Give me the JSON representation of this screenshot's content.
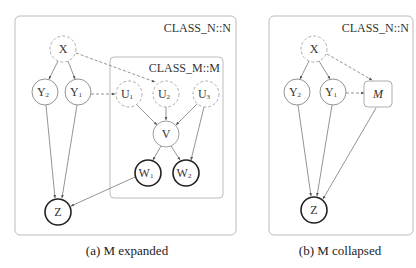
{
  "figure": {
    "panels": [
      {
        "id": "a",
        "caption": "(a) M expanded",
        "outer_class_label": "CLASS_N::N",
        "inner_class_label": "CLASS_M::M",
        "nodes": {
          "X": {
            "base": "X",
            "sub": ""
          },
          "Y2": {
            "base": "Y",
            "sub": "2"
          },
          "Y1": {
            "base": "Y",
            "sub": "1"
          },
          "U1": {
            "base": "U",
            "sub": "1"
          },
          "U2": {
            "base": "U",
            "sub": "2"
          },
          "U3": {
            "base": "U",
            "sub": "3"
          },
          "V": {
            "base": "V",
            "sub": ""
          },
          "W1": {
            "base": "W",
            "sub": "1"
          },
          "W2": {
            "base": "W",
            "sub": "2"
          },
          "Z": {
            "base": "Z",
            "sub": ""
          }
        },
        "edges": [
          {
            "from": "X",
            "to": "Y2",
            "style": "solid"
          },
          {
            "from": "X",
            "to": "Y1",
            "style": "solid"
          },
          {
            "from": "X",
            "to": "U2",
            "style": "dashed"
          },
          {
            "from": "Y1",
            "to": "U1",
            "style": "dashed"
          },
          {
            "from": "U1",
            "to": "V",
            "style": "solid"
          },
          {
            "from": "U2",
            "to": "V",
            "style": "solid"
          },
          {
            "from": "U3",
            "to": "V",
            "style": "solid"
          },
          {
            "from": "U3",
            "to": "W2",
            "style": "solid"
          },
          {
            "from": "V",
            "to": "W1",
            "style": "solid"
          },
          {
            "from": "V",
            "to": "W2",
            "style": "solid"
          },
          {
            "from": "Y2",
            "to": "Z",
            "style": "solid"
          },
          {
            "from": "Y1",
            "to": "Z",
            "style": "solid"
          },
          {
            "from": "W1",
            "to": "Z",
            "style": "solid"
          }
        ]
      },
      {
        "id": "b",
        "caption": "(b) M collapsed",
        "outer_class_label": "CLASS_N::N",
        "nodes": {
          "X": {
            "base": "X",
            "sub": ""
          },
          "Y2": {
            "base": "Y",
            "sub": "2"
          },
          "Y1": {
            "base": "Y",
            "sub": "1"
          },
          "M": {
            "base": "M",
            "sub": ""
          },
          "Z": {
            "base": "Z",
            "sub": ""
          }
        },
        "edges": [
          {
            "from": "X",
            "to": "Y2",
            "style": "solid"
          },
          {
            "from": "X",
            "to": "Y1",
            "style": "solid"
          },
          {
            "from": "X",
            "to": "M",
            "style": "dashed"
          },
          {
            "from": "Y1",
            "to": "M",
            "style": "dashed"
          },
          {
            "from": "Y2",
            "to": "Z",
            "style": "solid"
          },
          {
            "from": "Y1",
            "to": "Z",
            "style": "solid"
          },
          {
            "from": "M",
            "to": "Z",
            "style": "solid"
          }
        ]
      }
    ],
    "colors": {
      "box_stroke": "#bbbbbb",
      "dashed_node_stroke": "#999999",
      "normal_node_stroke": "#777777",
      "observed_node_stroke": "#222222",
      "edge": "#666666",
      "text": "#333333"
    }
  }
}
